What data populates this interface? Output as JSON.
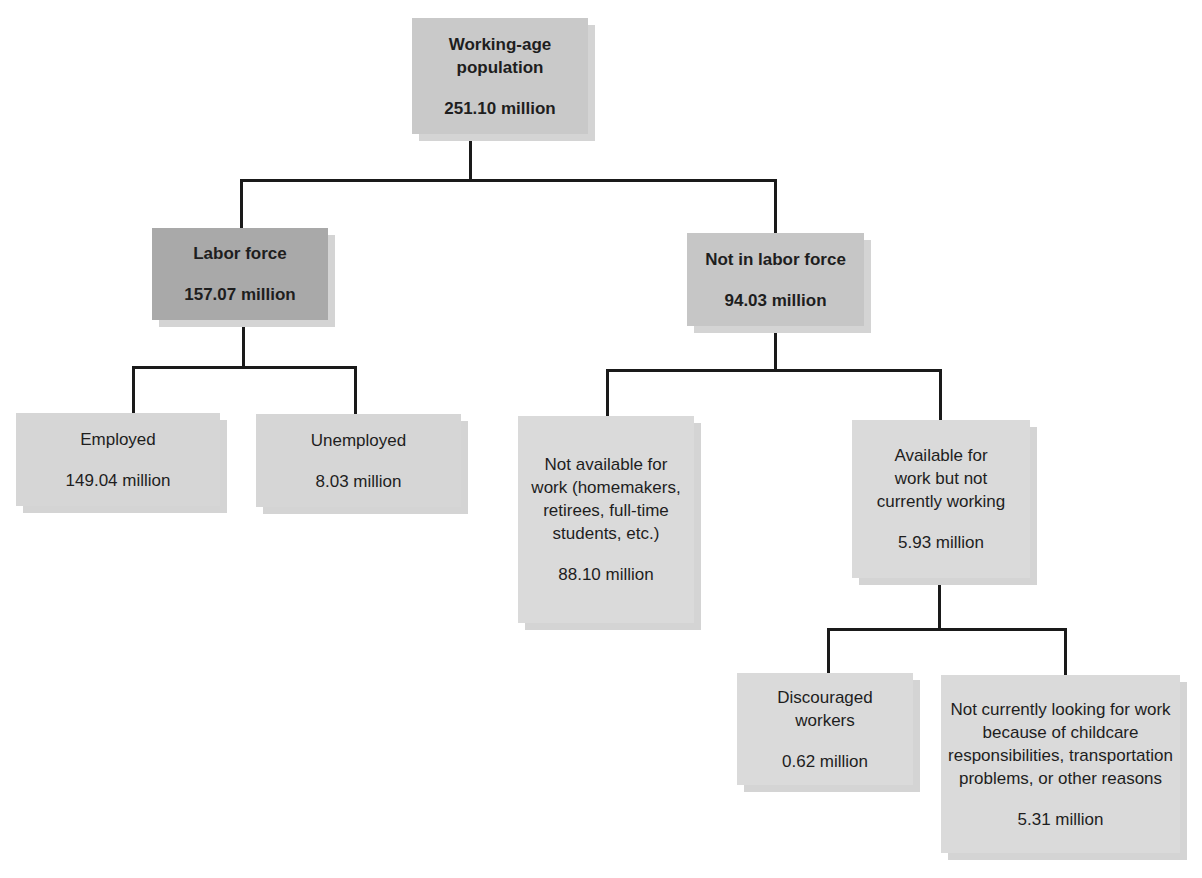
{
  "diagram": {
    "type": "tree",
    "colors": {
      "root": "#c9c9c9",
      "labor_force": "#a9a9a9",
      "not_in_labor_force": "#c6c6c6",
      "leaf": "#d6d6d6",
      "connector": "#1a1a1a",
      "shadow": "#d4d4d4"
    },
    "nodes": {
      "root": {
        "label": "Working-age population",
        "value": "251.10 million"
      },
      "labor_force": {
        "label": "Labor force",
        "value": "157.07 million"
      },
      "not_in_labor_force": {
        "label": "Not in labor force",
        "value": "94.03 million"
      },
      "employed": {
        "label": "Employed",
        "value": "149.04 million"
      },
      "unemployed": {
        "label": "Unemployed",
        "value": "8.03 million"
      },
      "not_available": {
        "label": "Not available for work (homemakers, retirees, full-time students, etc.)",
        "value": "88.10 million"
      },
      "available_not_working": {
        "label": "Available for work but not currently working",
        "value": "5.93 million"
      },
      "discouraged": {
        "label": "Discouraged workers",
        "value": "0.62 million"
      },
      "not_looking": {
        "label": "Not currently looking for work because of childcare responsibilities, transportation problems, or other reasons",
        "value": "5.31 million"
      }
    },
    "edges": [
      [
        "root",
        "labor_force"
      ],
      [
        "root",
        "not_in_labor_force"
      ],
      [
        "labor_force",
        "employed"
      ],
      [
        "labor_force",
        "unemployed"
      ],
      [
        "not_in_labor_force",
        "not_available"
      ],
      [
        "not_in_labor_force",
        "available_not_working"
      ],
      [
        "available_not_working",
        "discouraged"
      ],
      [
        "available_not_working",
        "not_looking"
      ]
    ]
  }
}
